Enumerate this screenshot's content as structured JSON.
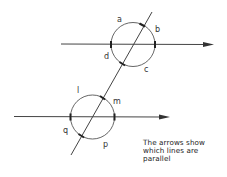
{
  "diagram": {
    "type": "parallel-lines-transversal",
    "upper_circle": {
      "angle_labels": {
        "a": "a",
        "b": "b",
        "c": "c",
        "d": "d"
      }
    },
    "lower_circle": {
      "angle_labels": {
        "l": "l",
        "m": "m",
        "p": "p",
        "q": "q"
      }
    },
    "note_lines": [
      "The arrows show",
      "which lines are",
      "parallel"
    ],
    "colors": {
      "line": "#444444",
      "background": "#ffffff"
    }
  }
}
